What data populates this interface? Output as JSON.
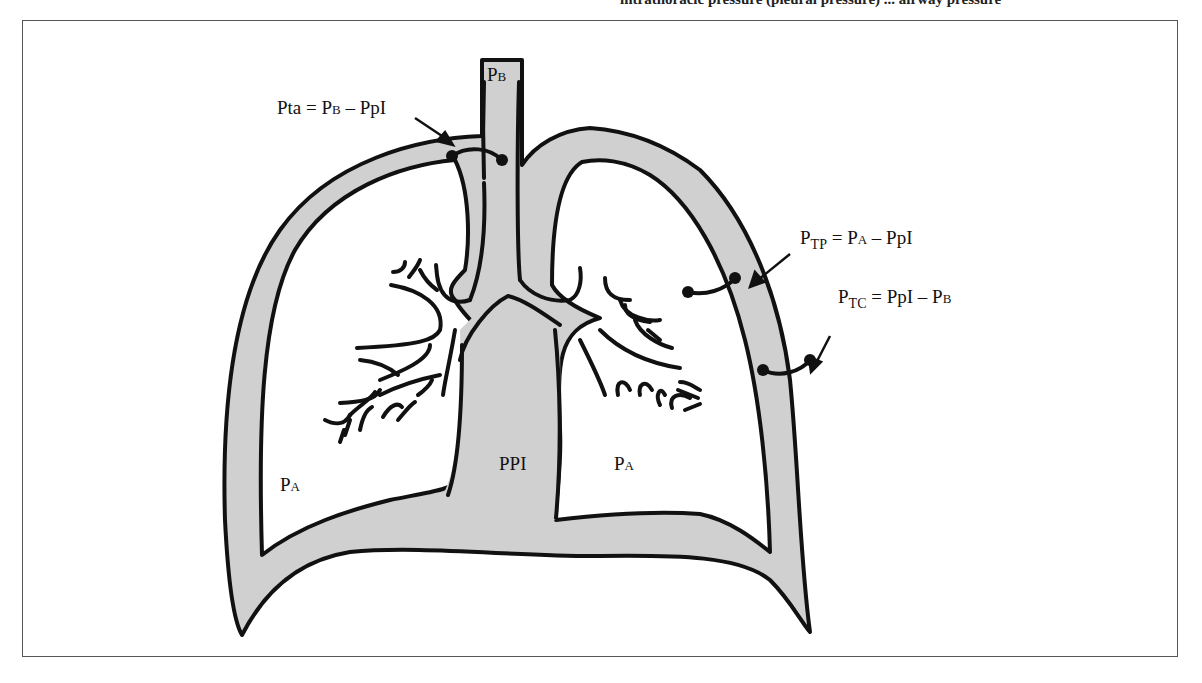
{
  "caption_cutoff": "intrathoracic pressure (pleural pressure) ... airway pressure",
  "colors": {
    "tissue": "#d0d0d0",
    "ink": "#111111",
    "frame": "#555555",
    "background": "#ffffff"
  },
  "labels": {
    "airway_opening": {
      "main": "P",
      "small": "B"
    },
    "transairway": {
      "text": "Pta = P",
      "small": "B",
      "rest": " – PpI"
    },
    "transpulmonary": {
      "main": "P",
      "sub": "TP",
      "eq": " = P",
      "small": "A",
      "rest": " – PpI"
    },
    "transchest": {
      "main": "P",
      "sub": "TC",
      "eq": " = PpI – P",
      "small": "B"
    },
    "alveolar_left": {
      "main": "P",
      "small": "A"
    },
    "alveolar_right": {
      "main": "P",
      "small": "A"
    },
    "pleural": "PPI"
  }
}
